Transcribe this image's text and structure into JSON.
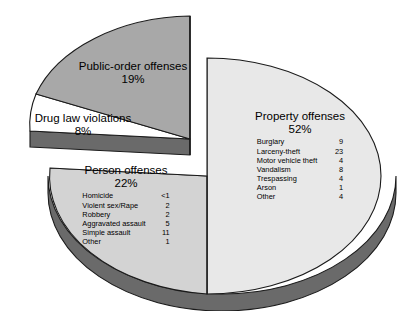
{
  "chart_data": {
    "type": "pie",
    "title": "",
    "subtitle": "",
    "xlabel": "",
    "ylabel": "",
    "legend_position": "on-slice",
    "grid": false,
    "exploded_slices": [
      "Public-order offenses",
      "Drug law violations"
    ],
    "categories": [
      "Property offenses",
      "Person offenses",
      "Public-order offenses",
      "Drug law violations"
    ],
    "values": [
      52,
      22,
      19,
      8
    ],
    "unit": "percent",
    "series": [
      {
        "name": "Share of offenses",
        "values": [
          52,
          22,
          19,
          8
        ]
      }
    ],
    "slices": [
      {
        "label": "Property offenses",
        "percent_text": "52%",
        "value": 52,
        "color": "#e8e8e8",
        "items": [
          {
            "name": "Burglary",
            "value": "9"
          },
          {
            "name": "Larceny-theft",
            "value": "23"
          },
          {
            "name": "Motor vehicle theft",
            "value": "4"
          },
          {
            "name": "Vandalism",
            "value": "8"
          },
          {
            "name": "Trespassing",
            "value": "4"
          },
          {
            "name": "Arson",
            "value": "1"
          },
          {
            "name": "Other",
            "value": "4"
          }
        ]
      },
      {
        "label": "Person offenses",
        "percent_text": "22%",
        "value": 22,
        "color": "#d3d3d3",
        "items": [
          {
            "name": "Homicide",
            "value": "<1"
          },
          {
            "name": "Violent sex/Rape",
            "value": "2"
          },
          {
            "name": "Robbery",
            "value": "2"
          },
          {
            "name": "Aggravated assault",
            "value": "5"
          },
          {
            "name": "Simple assault",
            "value": "11"
          },
          {
            "name": "Other",
            "value": "1"
          }
        ]
      },
      {
        "label": "Public-order offenses",
        "percent_text": "19%",
        "value": 19,
        "color": "#a8a8a8",
        "items": []
      },
      {
        "label": "Drug law violations",
        "percent_text": "8%",
        "value": 8,
        "color": "#ffffff",
        "items": []
      }
    ]
  },
  "colors": {
    "property_fill": "#e8e8e8",
    "person_fill": "#d3d3d3",
    "publicorder_fill": "#a8a8a8",
    "druglaw_fill": "#ffffff",
    "side_wall": "#6a6a6a",
    "outline": "#1a1a1a",
    "background": "#ffffff",
    "text": "#000000"
  }
}
